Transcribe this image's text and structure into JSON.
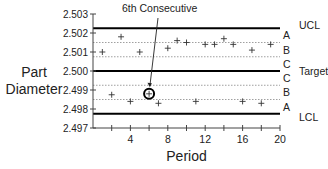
{
  "chart_data": {
    "type": "scatter",
    "title": "",
    "annotation": "6th Consecutive",
    "annotated_period": 6,
    "xlabel": "Period",
    "ylabel_lines": [
      "Part",
      "Diameter"
    ],
    "xlim": [
      0,
      20
    ],
    "ylim": [
      2.497,
      2.503
    ],
    "x_ticks": [
      4,
      8,
      12,
      16,
      20
    ],
    "x_minor_step": 2,
    "y_ticks": [
      "2.503",
      "2.502",
      "2.501",
      "2.500",
      "2.499",
      "2.498",
      "2.497"
    ],
    "grid": false,
    "control_lines": {
      "UCL": 2.50225,
      "Target": 2.5,
      "LCL": 2.49775
    },
    "zone_lines": [
      2.5015,
      2.50075,
      2.49925,
      2.4985
    ],
    "zone_labels": [
      {
        "label": "A",
        "value": 2.50188
      },
      {
        "label": "B",
        "value": 2.50112
      },
      {
        "label": "C",
        "value": 2.50038
      },
      {
        "label": "C",
        "value": 2.49962
      },
      {
        "label": "B",
        "value": 2.49888
      },
      {
        "label": "A",
        "value": 2.49812
      }
    ],
    "right_labels": [
      {
        "label": "UCL",
        "value": 2.5024
      },
      {
        "label": "Target",
        "value": 2.5
      },
      {
        "label": "LCL",
        "value": 2.4976
      }
    ],
    "series": [
      {
        "name": "Part Diameter",
        "marker": "+",
        "x": [
          1,
          2,
          3,
          4,
          5,
          6,
          7,
          8,
          9,
          10,
          11,
          12,
          13,
          14,
          15,
          16,
          17,
          18,
          19
        ],
        "values": [
          2.501,
          2.49875,
          2.5018,
          2.4984,
          2.501,
          2.4988,
          2.4983,
          2.5012,
          2.5016,
          2.5015,
          2.4984,
          2.5014,
          2.5014,
          2.5017,
          2.5014,
          2.4984,
          2.5011,
          2.4983,
          2.5014
        ]
      }
    ]
  }
}
